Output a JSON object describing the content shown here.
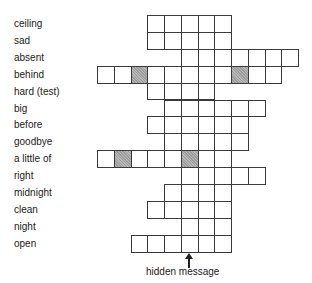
{
  "puzzle": {
    "grid": {
      "origin_x": 97,
      "origin_y": 15,
      "cell_width": 16.75,
      "cell_height": 16.9,
      "border_color": "#3a3a3a",
      "shaded_color": "#a9a9a9"
    },
    "rows": [
      {
        "clue": "ceiling",
        "start_col": 3,
        "length": 5,
        "shaded_cols": []
      },
      {
        "clue": "sad",
        "start_col": 3,
        "length": 5,
        "shaded_cols": []
      },
      {
        "clue": "absent",
        "start_col": 5,
        "length": 7,
        "shaded_cols": []
      },
      {
        "clue": "behind",
        "start_col": 0,
        "length": 11,
        "shaded_cols": [
          2,
          8
        ]
      },
      {
        "clue": "hard (test)",
        "start_col": 3,
        "length": 4,
        "shaded_cols": []
      },
      {
        "clue": "big",
        "start_col": 4,
        "length": 6,
        "shaded_cols": []
      },
      {
        "clue": "before",
        "start_col": 3,
        "length": 6,
        "shaded_cols": []
      },
      {
        "clue": "goodbye",
        "start_col": 4,
        "length": 5,
        "shaded_cols": []
      },
      {
        "clue": "a little of",
        "start_col": 0,
        "length": 8,
        "shaded_cols": [
          1,
          5
        ]
      },
      {
        "clue": "right",
        "start_col": 5,
        "length": 5,
        "shaded_cols": []
      },
      {
        "clue": "midnight",
        "start_col": 4,
        "length": 4,
        "shaded_cols": []
      },
      {
        "clue": "clean",
        "start_col": 3,
        "length": 5,
        "shaded_cols": []
      },
      {
        "clue": "night",
        "start_col": 5,
        "length": 3,
        "shaded_cols": []
      },
      {
        "clue": "open",
        "start_col": 2,
        "length": 6,
        "shaded_cols": []
      }
    ],
    "hidden_message": {
      "label": "hidden message",
      "column": 5,
      "icon": "arrow-up-icon"
    }
  }
}
